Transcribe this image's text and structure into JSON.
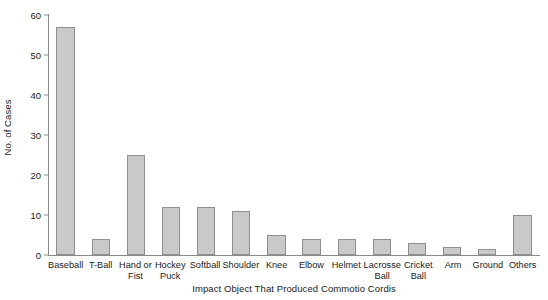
{
  "chart_data": {
    "type": "bar",
    "title": "",
    "xlabel": "Impact Object That Produced Commotio Cordis",
    "ylabel": "No. of Cases",
    "categories": [
      "Baseball",
      "T-Ball",
      "Hand or Fist",
      "Hockey Puck",
      "Softball",
      "Shoulder",
      "Knee",
      "Elbow",
      "Helmet",
      "Lacrosse Ball",
      "Cricket Ball",
      "Arm",
      "Ground",
      "Others"
    ],
    "values": [
      57,
      4,
      25,
      12,
      12,
      11,
      5,
      4,
      4,
      4,
      3,
      2,
      1.5,
      10
    ],
    "ylim": [
      0,
      60
    ],
    "yticks": [
      0,
      10,
      20,
      30,
      40,
      50,
      60
    ],
    "ytick_labels": [
      "0",
      "10",
      "20",
      "30",
      "40",
      "50",
      "60"
    ],
    "grid": false,
    "legend": false,
    "legend_position": "none",
    "bar_fill_color": "#c9c9c9",
    "bar_edge_color": "#8f8f8f",
    "axis_color": "#8a8a8a",
    "text_color": "#1a1a1a",
    "background_color": "#ffffff"
  }
}
